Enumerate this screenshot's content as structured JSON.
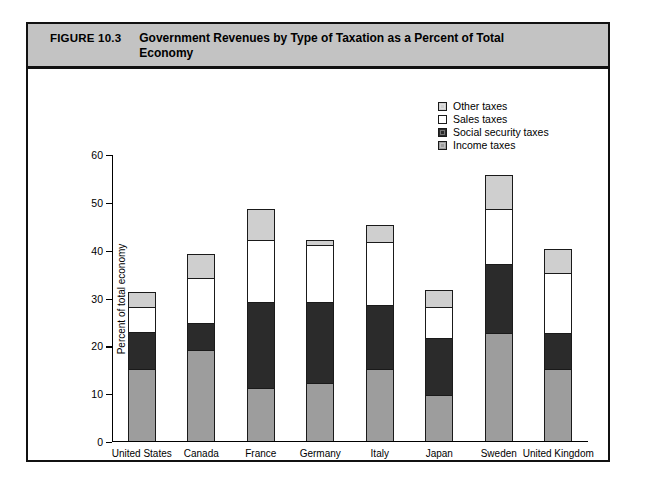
{
  "figure": {
    "number": "FIGURE 10.3",
    "title": "Government Revenues by Type of Taxation as a Percent of Total Economy",
    "header_bg": "#c3c3c3",
    "border_color": "#111111"
  },
  "chart_data": {
    "type": "bar",
    "stacked": true,
    "title": "Government Revenues by Type of Taxation as a Percent of Total Economy",
    "xlabel": "",
    "ylabel": "Percent of total economy",
    "ylim": [
      0,
      60
    ],
    "yticks": [
      0,
      10,
      20,
      30,
      40,
      50,
      60
    ],
    "grid": false,
    "legend_position": "top-right",
    "categories": [
      "United States",
      "Canada",
      "France",
      "Germany",
      "Italy",
      "Japan",
      "Sweden",
      "United Kingdom"
    ],
    "series": [
      {
        "name": "Income taxes",
        "color": "#9d9d9d",
        "values": [
          15.0,
          19.0,
          11.0,
          12.0,
          15.0,
          9.5,
          22.5,
          15.0
        ]
      },
      {
        "name": "Social security taxes",
        "color": "#2b2b2b",
        "values": [
          7.8,
          5.5,
          18.0,
          17.0,
          13.3,
          12.0,
          14.5,
          7.5
        ]
      },
      {
        "name": "Sales taxes",
        "color": "#ffffff",
        "values": [
          5.2,
          9.5,
          13.0,
          12.0,
          13.2,
          6.5,
          11.5,
          12.5
        ]
      },
      {
        "name": "Other taxes",
        "color": "#cfcfcf",
        "values": [
          3.1,
          5.0,
          6.5,
          1.0,
          3.5,
          3.5,
          7.0,
          5.0
        ]
      }
    ],
    "totals": [
      31.1,
      39.0,
      48.5,
      42.0,
      45.0,
      31.5,
      55.5,
      40.0
    ]
  },
  "legend": {
    "entries": [
      {
        "label": "Other taxes",
        "color": "#cfcfcf"
      },
      {
        "label": "Sales taxes",
        "color": "#ffffff"
      },
      {
        "label": "Social security taxes",
        "color": "#2b2b2b"
      },
      {
        "label": "Income taxes",
        "color": "#9d9d9d"
      }
    ]
  }
}
